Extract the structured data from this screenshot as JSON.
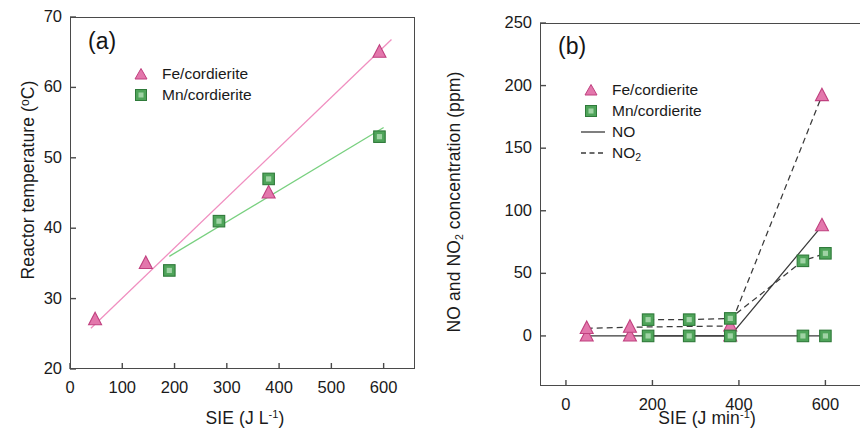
{
  "figure": {
    "kind": "two-panel-scientific-figure",
    "background": "#ffffff",
    "colors": {
      "fe_pink": "#e377ac",
      "fe_pink_edge": "#c0407f",
      "mn_green": "#4fa45a",
      "mn_green_edge": "#2f7a3a",
      "fit_pink": "#f08fc0",
      "fit_green": "#78d07f",
      "axis": "#4a4a4a",
      "line_dark": "#3a3a3a",
      "text": "#1a1a1a"
    }
  },
  "panel_a": {
    "tag": "(a)",
    "legend": [
      {
        "label": "Fe/cordierite",
        "marker": "triangle-pink"
      },
      {
        "label": "Mn/cordierite",
        "marker": "square-green"
      }
    ]
  },
  "panel_b": {
    "tag": "(b)",
    "legend": [
      {
        "label": "Fe/cordierite",
        "marker": "triangle-pink"
      },
      {
        "label": "Mn/cordierite",
        "marker": "square-green"
      },
      {
        "label": "NO",
        "marker": "line-solid"
      },
      {
        "label": "NO2",
        "label_html": "NO<sub>2</sub>",
        "marker": "line-dashed"
      }
    ]
  },
  "chart_data": [
    {
      "panel": "a",
      "type": "scatter",
      "title": "(a)",
      "xlabel": "SIE (J L-1)",
      "xlabel_html": "SIE (J L<sup>-1</sup>)",
      "ylabel": "Reactor temperature (°C)",
      "xlim": [
        0,
        660
      ],
      "ylim": [
        20,
        70
      ],
      "xticks": [
        0,
        100,
        200,
        300,
        400,
        500,
        600
      ],
      "xticklabels": [
        "0",
        "100",
        "200",
        "300",
        "400",
        "500",
        "600"
      ],
      "yticks": [
        20,
        30,
        40,
        50,
        60,
        70
      ],
      "yticklabels": [
        "20",
        "30",
        "40",
        "50",
        "60",
        "70"
      ],
      "grid": false,
      "legend_position": "upper-left-inside",
      "series": [
        {
          "name": "Fe/cordierite",
          "marker": "triangle",
          "color": "#e377ac",
          "x": [
            48,
            145,
            380,
            592
          ],
          "y": [
            27,
            35,
            45,
            65
          ],
          "fit_line": {
            "x": [
              40,
              615
            ],
            "y": [
              25.8,
              66.8
            ],
            "color": "#f08fc0",
            "style": "solid"
          }
        },
        {
          "name": "Mn/cordierite",
          "marker": "square",
          "color": "#4fa45a",
          "x": [
            190,
            285,
            380,
            592
          ],
          "y": [
            34,
            41,
            47,
            53
          ],
          "fit_line": {
            "x": [
              190,
              600
            ],
            "y": [
              36.0,
              54.3
            ],
            "color": "#78d07f",
            "style": "solid"
          }
        }
      ]
    },
    {
      "panel": "b",
      "type": "line",
      "title": "(b)",
      "xlabel": "SIE (J min-1)",
      "xlabel_html": "SIE (J min<sup>-1</sup>)",
      "ylabel": "NO and NO2 concentration (ppm)",
      "ylabel_html": "NO and NO<sub>2</sub> concentration (ppm)",
      "xlim": [
        -60,
        680
      ],
      "ylim": [
        -40,
        250
      ],
      "xticks": [
        0,
        200,
        400,
        600
      ],
      "xticklabels": [
        "0",
        "200",
        "400",
        "600"
      ],
      "yticks": [
        0,
        50,
        100,
        150,
        200,
        250
      ],
      "yticklabels": [
        "0",
        "50",
        "100",
        "150",
        "200",
        "250"
      ],
      "grid": false,
      "legend_position": "upper-left-inside",
      "series": [
        {
          "name": "Fe/cordierite NO",
          "marker": "triangle",
          "color": "#e377ac",
          "line_style": "solid",
          "x": [
            48,
            148,
            380,
            592
          ],
          "y": [
            0,
            0,
            0,
            88
          ]
        },
        {
          "name": "Fe/cordierite NO2",
          "marker": "triangle",
          "color": "#e377ac",
          "line_style": "dashed",
          "x": [
            48,
            148,
            380,
            592
          ],
          "y": [
            6,
            7,
            8,
            192
          ]
        },
        {
          "name": "Mn/cordierite NO",
          "marker": "square",
          "color": "#4fa45a",
          "line_style": "solid",
          "x": [
            190,
            285,
            380,
            548,
            600
          ],
          "y": [
            0,
            0,
            0,
            0,
            0
          ]
        },
        {
          "name": "Mn/cordierite NO2",
          "marker": "square",
          "color": "#4fa45a",
          "line_style": "dashed",
          "x": [
            190,
            285,
            380,
            548,
            600
          ],
          "y": [
            13,
            13,
            14,
            60,
            66
          ]
        }
      ]
    }
  ]
}
